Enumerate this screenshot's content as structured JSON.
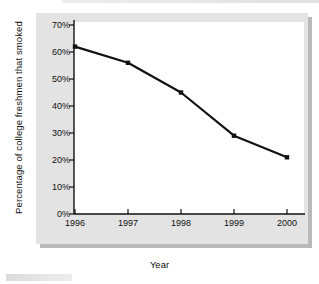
{
  "chart_data": {
    "type": "line",
    "title": "",
    "xlabel": "Year",
    "ylabel": "Percentage of college freshmen that smoked",
    "categories": [
      "1996",
      "1997",
      "1998",
      "1999",
      "2000"
    ],
    "x": [
      1996,
      1997,
      1998,
      1999,
      2000
    ],
    "values": [
      62,
      56,
      45,
      29,
      21
    ],
    "series": [
      {
        "name": "Percentage of college freshmen that smoked",
        "values": [
          62,
          56,
          45,
          29,
          21
        ]
      }
    ],
    "ylim": [
      0,
      70
    ],
    "xlim": [
      1996,
      2000
    ],
    "ytick_labels": [
      "0%",
      "10%",
      "20%",
      "30%",
      "40%",
      "50%",
      "60%",
      "70%"
    ],
    "ytick_values": [
      0,
      10,
      20,
      30,
      40,
      50,
      60,
      70
    ],
    "xtick_labels": [
      "1996",
      "1997",
      "1998",
      "1999",
      "2000"
    ],
    "grid": false,
    "legend": "none",
    "marker": "square",
    "line_color": "#111111",
    "marker_color": "#111111",
    "panel_color": "#e3e3e3",
    "plot_color": "#ffffff"
  }
}
